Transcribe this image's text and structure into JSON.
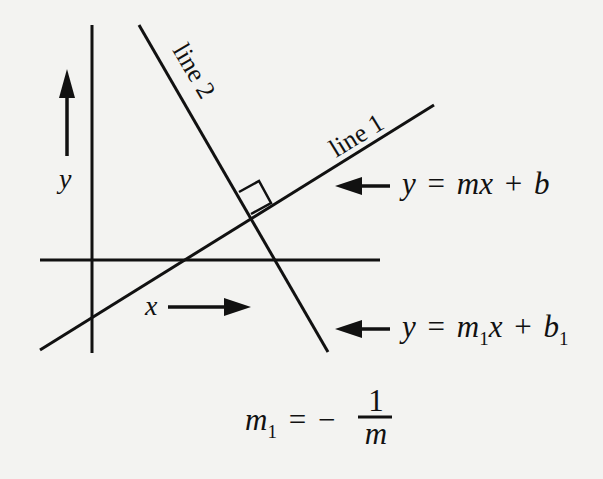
{
  "diagram": {
    "type": "perpendicular-lines-figure",
    "background": "#f3f3f1",
    "ink": "#111111",
    "axis_labels": {
      "y": "y",
      "x": "x"
    },
    "line_labels": {
      "line1": "line 1",
      "line2": "line 2"
    },
    "equations": {
      "line1": {
        "lhs": "y",
        "eq": "=",
        "m": "m",
        "x": "x",
        "plus": "+",
        "b": "b"
      },
      "line2": {
        "lhs": "y",
        "eq": "=",
        "m": "m",
        "m_sub": "1",
        "x": "x",
        "plus": "+",
        "b": "b",
        "b_sub": "1"
      }
    },
    "relation": {
      "lhs": "m",
      "lhs_sub": "1",
      "eq": "=",
      "minus": "−",
      "numerator": "1",
      "denominator": "m"
    },
    "annotations": {
      "right_angle": "perpendicular intersection of line 1 and line 2"
    }
  }
}
